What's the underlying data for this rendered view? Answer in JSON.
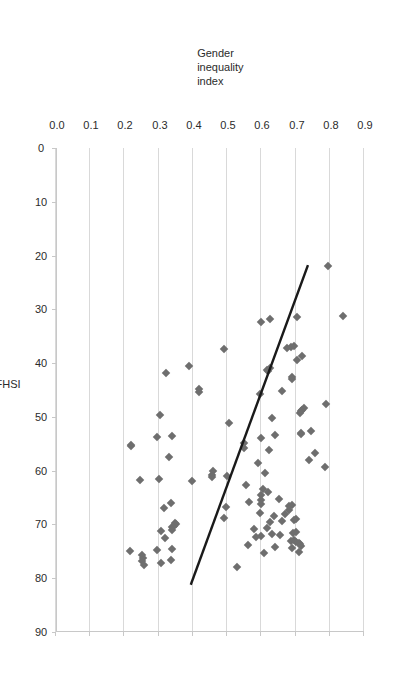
{
  "figure": {
    "orientation": "rotated-90-ccw",
    "marker_color": "#6e6e6e",
    "gridline_color": "#d9d9d9",
    "trendline_color": "#1a1a1a"
  },
  "chart_data": {
    "type": "scatter",
    "title": "",
    "xlabel": "FHSI",
    "ylabel": "Gender inequality index",
    "ylabel_lines": [
      "Gender",
      "inequality",
      "index"
    ],
    "xlim": [
      0,
      90
    ],
    "ylim": [
      0.0,
      0.9
    ],
    "y_axis_inverted": true,
    "xticks": [
      0,
      10,
      20,
      30,
      40,
      50,
      60,
      70,
      80,
      90
    ],
    "xticklabels": [
      "0",
      "10",
      "20",
      "30",
      "40",
      "50",
      "60",
      "70",
      "80",
      "90"
    ],
    "yticks": [
      0.9,
      0.8,
      0.7,
      0.6,
      0.5,
      0.4,
      0.3,
      0.2,
      0.1,
      0.0
    ],
    "yticklabels": [
      "0.9",
      "0.8",
      "0.7",
      "0.6",
      "0.5",
      "0.4",
      "0.3",
      "0.2",
      "0.1",
      "0.0"
    ],
    "grid": "y-gridlines-only",
    "legend": "none",
    "marker": "diamond",
    "points": [
      [
        22.0,
        0.795
      ],
      [
        31.3,
        0.84
      ],
      [
        31.5,
        0.705
      ],
      [
        31.8,
        0.625
      ],
      [
        32.4,
        0.6
      ],
      [
        36.8,
        0.695
      ],
      [
        37.0,
        0.688
      ],
      [
        37.2,
        0.675
      ],
      [
        37.4,
        0.49
      ],
      [
        38.6,
        0.718
      ],
      [
        39.4,
        0.705
      ],
      [
        40.6,
        0.388
      ],
      [
        41.0,
        0.625
      ],
      [
        41.2,
        0.618
      ],
      [
        41.5,
        0.62
      ],
      [
        41.8,
        0.32
      ],
      [
        42.5,
        0.69
      ],
      [
        43.0,
        0.69
      ],
      [
        44.8,
        0.418
      ],
      [
        45.2,
        0.66
      ],
      [
        45.4,
        0.418
      ],
      [
        45.8,
        0.595
      ],
      [
        47.6,
        0.79
      ],
      [
        48.4,
        0.725
      ],
      [
        48.8,
        0.718
      ],
      [
        48.9,
        0.716
      ],
      [
        49.2,
        0.712
      ],
      [
        49.6,
        0.305
      ],
      [
        50.2,
        0.632
      ],
      [
        51.2,
        0.505
      ],
      [
        52.6,
        0.745
      ],
      [
        53.0,
        0.715
      ],
      [
        53.2,
        0.715
      ],
      [
        53.4,
        0.64
      ],
      [
        53.6,
        0.34
      ],
      [
        53.8,
        0.295
      ],
      [
        54.0,
        0.6
      ],
      [
        54.8,
        0.548
      ],
      [
        55.2,
        0.218
      ],
      [
        55.4,
        0.22
      ],
      [
        55.8,
        0.55
      ],
      [
        56.2,
        0.622
      ],
      [
        56.8,
        0.758
      ],
      [
        57.4,
        0.33
      ],
      [
        58.0,
        0.738
      ],
      [
        58.6,
        0.59
      ],
      [
        59.4,
        0.785
      ],
      [
        60.0,
        0.46
      ],
      [
        60.4,
        0.612
      ],
      [
        60.8,
        0.455
      ],
      [
        61.0,
        0.5
      ],
      [
        61.2,
        0.455
      ],
      [
        61.6,
        0.3
      ],
      [
        61.8,
        0.245
      ],
      [
        62.0,
        0.398
      ],
      [
        62.6,
        0.555
      ],
      [
        63.4,
        0.605
      ],
      [
        64.0,
        0.62
      ],
      [
        64.6,
        0.598
      ],
      [
        65.2,
        0.652
      ],
      [
        65.4,
        0.6
      ],
      [
        65.8,
        0.565
      ],
      [
        66.0,
        0.335
      ],
      [
        66.2,
        0.6
      ],
      [
        66.4,
        0.69
      ],
      [
        66.6,
        0.68
      ],
      [
        66.8,
        0.498
      ],
      [
        67.0,
        0.315
      ],
      [
        67.4,
        0.682
      ],
      [
        67.8,
        0.595
      ],
      [
        68.0,
        0.67
      ],
      [
        68.4,
        0.638
      ],
      [
        68.8,
        0.49
      ],
      [
        69.0,
        0.7
      ],
      [
        69.2,
        0.695
      ],
      [
        69.4,
        0.66
      ],
      [
        69.6,
        0.625
      ],
      [
        69.8,
        0.348
      ],
      [
        70.0,
        0.352
      ],
      [
        70.2,
        0.345
      ],
      [
        70.4,
        0.34
      ],
      [
        70.6,
        0.618
      ],
      [
        70.8,
        0.58
      ],
      [
        71.0,
        0.34
      ],
      [
        71.2,
        0.308
      ],
      [
        71.4,
        0.7
      ],
      [
        71.6,
        0.692
      ],
      [
        71.8,
        0.63
      ],
      [
        72.0,
        0.655
      ],
      [
        72.2,
        0.6
      ],
      [
        72.4,
        0.585
      ],
      [
        72.6,
        0.318
      ],
      [
        72.8,
        0.695
      ],
      [
        73.0,
        0.688
      ],
      [
        73.2,
        0.7
      ],
      [
        73.4,
        0.71
      ],
      [
        73.6,
        0.712
      ],
      [
        73.8,
        0.56
      ],
      [
        74.0,
        0.715
      ],
      [
        74.2,
        0.64
      ],
      [
        74.4,
        0.69
      ],
      [
        74.6,
        0.34
      ],
      [
        74.8,
        0.295
      ],
      [
        75.0,
        0.215
      ],
      [
        75.2,
        0.71
      ],
      [
        75.4,
        0.608
      ],
      [
        75.6,
        0.25
      ],
      [
        76.2,
        0.255
      ],
      [
        76.6,
        0.335
      ],
      [
        76.8,
        0.252
      ],
      [
        77.2,
        0.308
      ],
      [
        77.6,
        0.258
      ],
      [
        78.0,
        0.53
      ]
    ],
    "trendline": {
      "x": [
        22.0,
        81.0
      ],
      "y": [
        0.735,
        0.395
      ]
    }
  }
}
